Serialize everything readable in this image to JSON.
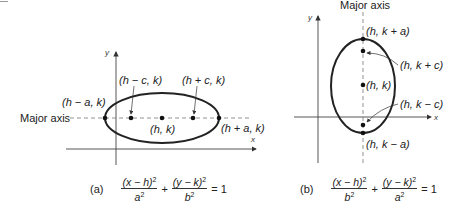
{
  "figure_a": {
    "tag": "(a)",
    "axis_x": "x",
    "axis_y": "y",
    "major_axis_label": "Major axis",
    "labels": {
      "left_vertex": "(h − a, k)",
      "right_vertex": "(h + a, k)",
      "left_focus": "(h − c, k)",
      "right_focus": "(h + c, k)",
      "center": "(h, k)"
    },
    "equation": {
      "num1": "(x − h)",
      "den1": "a",
      "num2": "(y − k)",
      "den2": "b",
      "exp": "2",
      "plus": "+",
      "rhs": "= 1"
    }
  },
  "figure_b": {
    "tag": "(b)",
    "axis_x": "x",
    "axis_y": "y",
    "major_axis_label": "Major axis",
    "labels": {
      "top_vertex": "(h, k + a)",
      "bottom_vertex": "(h, k − a)",
      "top_focus": "(h, k + c)",
      "bottom_focus": "(h, k − c)",
      "center": "(h, k)"
    },
    "equation": {
      "num1": "(x − h)",
      "den1": "b",
      "num2": "(y − k)",
      "den2": "a",
      "exp": "2",
      "plus": "+",
      "rhs": "= 1"
    }
  },
  "colors": {
    "ink": "#222222",
    "axis": "#444444",
    "dashed": "#777777"
  }
}
